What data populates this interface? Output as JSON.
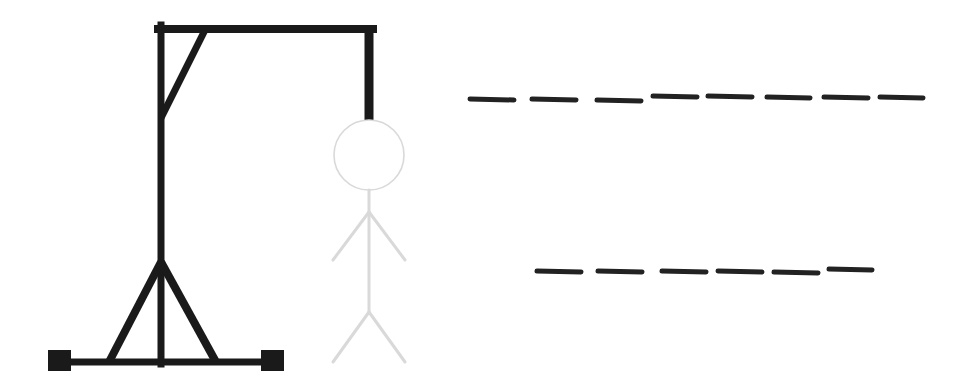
{
  "game": {
    "name": "Hangman",
    "colors": {
      "background": "#ffffff",
      "gallows": "#1a1a1a",
      "figure": "#d9d9d9",
      "blank": "#222222"
    },
    "gallows": {
      "post": {
        "x": 161,
        "y1": 25,
        "y2": 364,
        "width": 7
      },
      "top_beam": {
        "x1": 158,
        "x2": 373,
        "y": 29,
        "width": 8
      },
      "hanger": {
        "x": 369,
        "y1": 25,
        "y2": 120,
        "width": 9
      },
      "brace": {
        "x1": 205,
        "y1": 30,
        "x2": 161,
        "y2": 118,
        "width": 7
      },
      "legs": [
        {
          "x1": 161,
          "y1": 262,
          "x2": 109,
          "y2": 362,
          "width": 8
        },
        {
          "x1": 161,
          "y1": 262,
          "x2": 216,
          "y2": 362,
          "width": 8
        }
      ],
      "base": {
        "x1": 60,
        "x2": 272,
        "y": 362,
        "width": 7
      },
      "feet": [
        {
          "x": 48,
          "y": 350,
          "w": 23,
          "h": 21
        },
        {
          "x": 261,
          "y": 350,
          "w": 23,
          "h": 21
        }
      ]
    },
    "figure": {
      "state": "faded",
      "head": {
        "cx": 369,
        "cy": 155,
        "r": 35
      },
      "body": {
        "x": 369,
        "y1": 190,
        "y2": 312
      },
      "arms": [
        {
          "x1": 369,
          "y1": 212,
          "x2": 333,
          "y2": 260
        },
        {
          "x1": 369,
          "y1": 212,
          "x2": 405,
          "y2": 260
        }
      ],
      "legs": [
        {
          "x1": 369,
          "y1": 312,
          "x2": 333,
          "y2": 362
        },
        {
          "x1": 369,
          "y1": 312,
          "x2": 405,
          "y2": 362
        }
      ]
    },
    "words": [
      {
        "label": "word-1",
        "letter_count": 8,
        "revealed": [
          "",
          "",
          "",
          "",
          "",
          "",
          "",
          ""
        ],
        "slots": [
          {
            "x": 470,
            "y": 99,
            "w": 44
          },
          {
            "x": 532,
            "y": 99,
            "w": 44
          },
          {
            "x": 597,
            "y": 100,
            "w": 44
          },
          {
            "x": 653,
            "y": 96,
            "w": 44
          },
          {
            "x": 708,
            "y": 96,
            "w": 44
          },
          {
            "x": 767,
            "y": 97,
            "w": 43
          },
          {
            "x": 824,
            "y": 97,
            "w": 44
          },
          {
            "x": 880,
            "y": 97,
            "w": 43
          }
        ]
      },
      {
        "label": "word-2",
        "letter_count": 6,
        "revealed": [
          "",
          "",
          "",
          "",
          "",
          ""
        ],
        "slots": [
          {
            "x": 537,
            "y": 271,
            "w": 44
          },
          {
            "x": 598,
            "y": 271,
            "w": 44
          },
          {
            "x": 662,
            "y": 271,
            "w": 44
          },
          {
            "x": 718,
            "y": 271,
            "w": 44
          },
          {
            "x": 774,
            "y": 272,
            "w": 44
          },
          {
            "x": 829,
            "y": 269,
            "w": 43
          }
        ]
      }
    ]
  }
}
